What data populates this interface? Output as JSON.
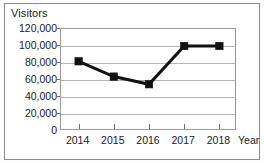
{
  "chart_data": {
    "type": "line",
    "title": "",
    "xlabel": "Year",
    "ylabel": "Visitors",
    "categories": [
      "2014",
      "2015",
      "2016",
      "2017",
      "2018"
    ],
    "x": [
      2014,
      2015,
      2016,
      2017,
      2018
    ],
    "values": [
      82000,
      64000,
      55000,
      100000,
      100000
    ],
    "series": [
      {
        "name": "Visitors",
        "values": [
          82000,
          64000,
          55000,
          100000,
          100000
        ]
      }
    ],
    "ylim": [
      0,
      120000
    ],
    "yticks": [
      0,
      20000,
      40000,
      60000,
      80000,
      100000,
      120000
    ],
    "ytick_labels": [
      "0",
      "20,000",
      "40,000",
      "60,000",
      "80,000",
      "100,000",
      "120,000"
    ],
    "xtick_labels": [
      "2014",
      "2015",
      "2016",
      "2017",
      "2018"
    ],
    "grid": true,
    "grid_axis": "y",
    "legend": false,
    "legend_position": "none",
    "marker": "square",
    "line_color": "#111111",
    "marker_color": "#111111",
    "grid_color": "#b4b4b4",
    "axis_color": "#9a9a9a",
    "background_color": "#ffffff"
  },
  "labels": {
    "y_axis_title": "Visitors",
    "x_axis_title": "Year"
  }
}
